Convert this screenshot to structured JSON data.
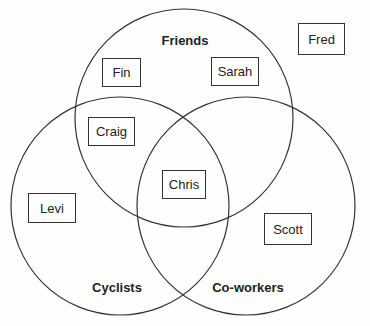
{
  "diagram": {
    "type": "venn",
    "sets": [
      {
        "id": "friends",
        "label": "Friends",
        "cx": 184,
        "cy": 118,
        "r": 109,
        "label_x": 185,
        "label_y": 45
      },
      {
        "id": "cyclists",
        "label": "Cyclists",
        "cx": 120,
        "cy": 206,
        "r": 109,
        "label_x": 117,
        "label_y": 292
      },
      {
        "id": "coworkers",
        "label": "Co-workers",
        "cx": 246,
        "cy": 206,
        "r": 109,
        "label_x": 248,
        "label_y": 292
      }
    ],
    "members": [
      {
        "name": "Fin",
        "sets": [
          "friends"
        ],
        "x": 102,
        "y": 58,
        "w": 39,
        "h": 29
      },
      {
        "name": "Sarah",
        "sets": [
          "friends"
        ],
        "x": 211,
        "y": 57,
        "w": 48,
        "h": 29
      },
      {
        "name": "Fred",
        "sets": [],
        "x": 298,
        "y": 23,
        "w": 47,
        "h": 32
      },
      {
        "name": "Craig",
        "sets": [
          "friends",
          "cyclists"
        ],
        "x": 88,
        "y": 117,
        "w": 47,
        "h": 29
      },
      {
        "name": "Chris",
        "sets": [
          "friends",
          "cyclists",
          "coworkers"
        ],
        "x": 162,
        "y": 170,
        "w": 44,
        "h": 29
      },
      {
        "name": "Levi",
        "sets": [
          "cyclists"
        ],
        "x": 28,
        "y": 193,
        "w": 48,
        "h": 30
      },
      {
        "name": "Scott",
        "sets": [
          "coworkers"
        ],
        "x": 264,
        "y": 213,
        "w": 48,
        "h": 32
      }
    ],
    "stroke_color": "#333333",
    "background": "#fefefe"
  }
}
